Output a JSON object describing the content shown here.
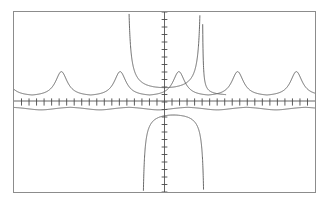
{
  "screen": {
    "name": "graphing-calculator-plot",
    "background_color": "#ffffff",
    "frame_color": "#8c8c8c",
    "curve_color": "#5a5a5a",
    "axis_color": "#555555"
  },
  "chart_data": {
    "type": "line",
    "title": "",
    "subtitle": "",
    "xlabel": "",
    "ylabel": "",
    "grid": false,
    "legend_position": "none",
    "xlim": [
      -6.2832,
      6.2832
    ],
    "ylim": [
      -4.0,
      4.0
    ],
    "x_axis": {
      "position_y": 0,
      "tick_count": 41,
      "tick_spacing": 0.3142,
      "tick_length": 0.16,
      "labels": []
    },
    "y_axis": {
      "position_x": 0,
      "tick_count": 25,
      "tick_spacing": 0.3333,
      "tick_length": 0.12,
      "labels": []
    },
    "series": [
      {
        "name": "secant-like-upper",
        "description": "periodic curve with sharp peaks above axis and vertical asymptotes near origin",
        "color": "#5a5a5a",
        "asymptotes_x": [
          -1.5708,
          1.5708
        ],
        "peaks_x": [
          -4.95,
          -2.6,
          0.6,
          3.05,
          5.5
        ],
        "peak_y": 1.35,
        "baseline_y": 0.25
      },
      {
        "name": "cosecant-like-lower",
        "description": "shallow periodic curve just below the axis with downward asymptote branch",
        "color": "#5a5a5a",
        "asymptotes_x": [
          -0.95,
          1.7
        ],
        "troughs_x": [
          -5.5,
          -3.1,
          2.2,
          4.6
        ],
        "trough_y": -0.35,
        "baseline_y": -0.18
      }
    ],
    "annotations": []
  }
}
